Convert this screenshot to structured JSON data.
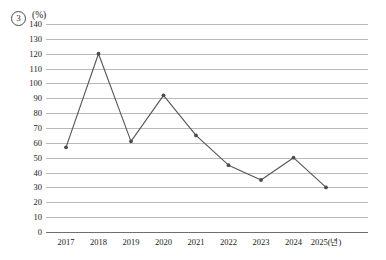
{
  "figure": {
    "index_label": "3",
    "unit_label": "(%)"
  },
  "chart_data": {
    "type": "line",
    "title": "",
    "xlabel": "2025(년)",
    "ylabel": "(%)",
    "categories": [
      "2017",
      "2018",
      "2019",
      "2020",
      "2021",
      "2022",
      "2023",
      "2024",
      "2025"
    ],
    "x_tick_labels": [
      "2017",
      "2018",
      "2019",
      "2020",
      "2021",
      "2022",
      "2023",
      "2024",
      "2025(년)"
    ],
    "values": [
      57,
      120,
      61,
      92,
      65,
      45,
      35,
      50,
      30
    ],
    "series": [
      {
        "name": "",
        "values": [
          57,
          120,
          61,
          92,
          65,
          45,
          35,
          50,
          30
        ]
      }
    ],
    "ylim": [
      0,
      140
    ],
    "ytick_step": 10,
    "y_tick_labels": [
      "140",
      "130",
      "120",
      "110",
      "100",
      "90",
      "80",
      "70",
      "60",
      "50",
      "40",
      "30",
      "20",
      "10",
      "0"
    ],
    "grid": true,
    "grid_axis": "y",
    "legend": false,
    "legend_position": "none",
    "marker": "circle",
    "line_color": "#55555a",
    "marker_color": "#4a4a50",
    "grid_color": "#b9b9b9",
    "axis_color": "#6f6f6f"
  }
}
